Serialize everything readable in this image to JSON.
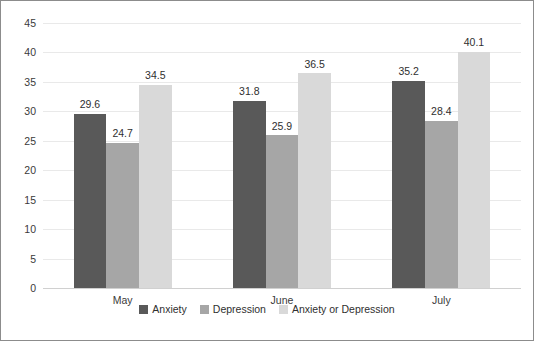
{
  "chart_data": {
    "type": "bar",
    "title": "",
    "subtitle": "",
    "xlabel": "",
    "ylabel": "",
    "categories": [
      "May",
      "June",
      "July"
    ],
    "series": [
      {
        "name": "Anxiety",
        "color": "#595959",
        "values": [
          29.6,
          31.8,
          35.2
        ]
      },
      {
        "name": "Depression",
        "color": "#a6a6a6",
        "values": [
          24.7,
          25.9,
          28.4
        ]
      },
      {
        "name": "Anxiety or Depression",
        "color": "#d9d9d9",
        "values": [
          34.5,
          36.5,
          40.1
        ]
      }
    ],
    "value_labels": [
      [
        "29.6",
        "24.7",
        "34.5"
      ],
      [
        "31.8",
        "25.9",
        "36.5"
      ],
      [
        "35.2",
        "28.4",
        "40.1"
      ]
    ],
    "ylim": [
      0,
      45
    ],
    "yticks": [
      0,
      5,
      10,
      15,
      20,
      25,
      30,
      35,
      40,
      45
    ],
    "ytick_labels": [
      "0",
      "5",
      "10",
      "15",
      "20",
      "25",
      "30",
      "35",
      "40",
      "45"
    ],
    "grid": true,
    "grid_axis": "y",
    "legend_position": "bottom",
    "border_color": "#8c8c8c",
    "gridline_color": "#e9e9e9",
    "background": "#ffffff"
  }
}
